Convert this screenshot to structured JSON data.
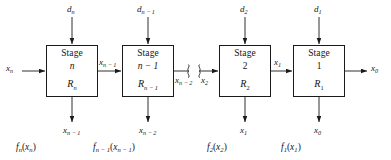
{
  "figure": {
    "type": "block-diagram",
    "stage_word": "Stage",
    "ellipsis_break": "break-marks"
  },
  "stages": [
    {
      "id": "stage-n",
      "title": "Stage",
      "index": "n",
      "return": "R",
      "return_sub": "n",
      "decision_label": "d",
      "decision_sub": "n",
      "input_label": "x",
      "input_sub": "n",
      "output_label": "x",
      "output_sub": "n − 1",
      "down_label": "x",
      "down_sub": "n − 1",
      "function_label": "f",
      "function_sub": "n",
      "function_arg": "x",
      "function_arg_sub": "n"
    },
    {
      "id": "stage-n-minus-1",
      "title": "Stage",
      "index": "n − 1",
      "return": "R",
      "return_sub": "n − 1",
      "decision_label": "d",
      "decision_sub": "n − 1",
      "input_label": "x",
      "input_sub": "n − 1",
      "output_label": "x",
      "output_sub": "n − 2",
      "down_label": "x",
      "down_sub": "n − 2",
      "function_label": "f",
      "function_sub": "n − 1",
      "function_arg": "x",
      "function_arg_sub": "n − 1"
    },
    {
      "id": "stage-2",
      "title": "Stage",
      "index": "2",
      "return": "R",
      "return_sub": "2",
      "decision_label": "d",
      "decision_sub": "2",
      "input_label": "x",
      "input_sub": "2",
      "output_label": "x",
      "output_sub": "1",
      "down_label": "x",
      "down_sub": "1",
      "function_label": "f",
      "function_sub": "2",
      "function_arg": "x",
      "function_arg_sub": "2"
    },
    {
      "id": "stage-1",
      "title": "Stage",
      "index": "1",
      "return": "R",
      "return_sub": "1",
      "decision_label": "d",
      "decision_sub": "1",
      "input_label": "x",
      "input_sub": "1",
      "output_label": "x",
      "output_sub": "0",
      "down_label": "x",
      "down_sub": "0",
      "function_label": "f",
      "function_sub": "1",
      "function_arg": "x",
      "function_arg_sub": "1"
    }
  ],
  "top_inputs": [
    {
      "base": "d",
      "sub": "n"
    },
    {
      "base": "d",
      "sub": "n − 1"
    },
    {
      "base": "d",
      "sub": "2"
    },
    {
      "base": "d",
      "sub": "1"
    }
  ],
  "flow_labels": {
    "far_left_input": {
      "base": "x",
      "sub": "n"
    },
    "between_1_2": {
      "base": "x",
      "sub": "n − 1"
    },
    "break_left": {
      "base": "x",
      "sub": "n − 2"
    },
    "break_right": {
      "base": "x",
      "sub": "2"
    },
    "between_3_4": {
      "base": "x",
      "sub": "1"
    },
    "far_right_output": {
      "base": "x",
      "sub": "0"
    }
  },
  "bottom_outputs": [
    {
      "base": "x",
      "sub": "n − 1"
    },
    {
      "base": "x",
      "sub": "n − 2"
    },
    {
      "base": "x",
      "sub": "1"
    },
    {
      "base": "x",
      "sub": "0"
    }
  ],
  "bottom_functions": [
    {
      "f": "f",
      "f_sub": "n",
      "arg": "x",
      "arg_sub": "n"
    },
    {
      "f": "f",
      "f_sub": "n − 1",
      "arg": "x",
      "arg_sub": "n − 1"
    },
    {
      "f": "f",
      "f_sub": "2",
      "arg": "x",
      "arg_sub": "2"
    },
    {
      "f": "f",
      "f_sub": "1",
      "arg": "x",
      "arg_sub": "1"
    }
  ],
  "colors": {
    "stroke": "#1a1a1a",
    "text": "#151515",
    "background": "#ffffff"
  }
}
